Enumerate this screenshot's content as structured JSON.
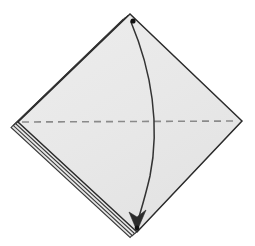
{
  "figure": {
    "type": "origami-fold-diagram",
    "canvas": {
      "width": 255,
      "height": 246,
      "background": "#ffffff"
    }
  },
  "colors": {
    "paper_fill": "#e8e8e8",
    "paper_fill_light": "#efefef",
    "edge_stroke": "#2b2b2b",
    "layer_stroke": "#3a3a3a",
    "fold_line": "#8a8a8a",
    "arrow_stroke": "#333333",
    "dot_fill": "#111111",
    "background": "#ffffff"
  },
  "geometry": {
    "vertices": {
      "top": {
        "label": "top-corner",
        "x": 130,
        "y": 14
      },
      "left": {
        "label": "left-corner",
        "x": 18,
        "y": 122
      },
      "right": {
        "label": "right-corner",
        "x": 242,
        "y": 121
      },
      "bottom": {
        "label": "bottom-corner",
        "x": 137,
        "y": 232
      }
    },
    "paper_outline_points": "130,14 242,121 137,232 18,122",
    "layer_count": 4,
    "layer_offset_px": 3.2,
    "layered_edge": "upper-left"
  },
  "fold_line": {
    "name": "valley-fold-line",
    "style": "dashed",
    "x1": 22,
    "y1": 122,
    "x2": 238,
    "y2": 121,
    "dash_pattern": "7 5",
    "stroke_width": 1.6
  },
  "fold_arrow": {
    "name": "fold-direction-arrow",
    "path": "M 131 22 C 152 72, 160 126, 150 176 C 144 202, 139 216, 137 224",
    "stroke_width": 1.5,
    "arrowhead": {
      "points": "137,231 129,212 137,217 146,210",
      "direction": "down"
    }
  },
  "markers": {
    "start_dot": {
      "name": "start-point-dot",
      "cx": 133,
      "cy": 21,
      "r": 2.6
    },
    "end_dot": {
      "name": "end-point-dot",
      "cx": 137,
      "cy": 228,
      "r": 2.4
    }
  },
  "chart_data": {
    "type": "diagram",
    "elements": [
      {
        "name": "paper-diamond",
        "kind": "polygon",
        "points": [
          [
            130,
            14
          ],
          [
            242,
            121
          ],
          [
            137,
            232
          ],
          [
            18,
            122
          ]
        ]
      },
      {
        "name": "layer-stack",
        "kind": "parallel-lines",
        "edge": [
          [
            130,
            14
          ],
          [
            18,
            122
          ]
        ],
        "count": 4
      },
      {
        "name": "valley-fold-line",
        "kind": "dashed-line",
        "from": [
          22,
          122
        ],
        "to": [
          238,
          121
        ]
      },
      {
        "name": "fold-direction-arrow",
        "kind": "curved-arrow",
        "from": [
          133,
          21
        ],
        "to": [
          137,
          228
        ],
        "bulge": "right"
      },
      {
        "name": "start-point-dot",
        "kind": "dot",
        "at": [
          133,
          21
        ]
      },
      {
        "name": "end-point-dot",
        "kind": "dot",
        "at": [
          137,
          228
        ]
      }
    ]
  }
}
